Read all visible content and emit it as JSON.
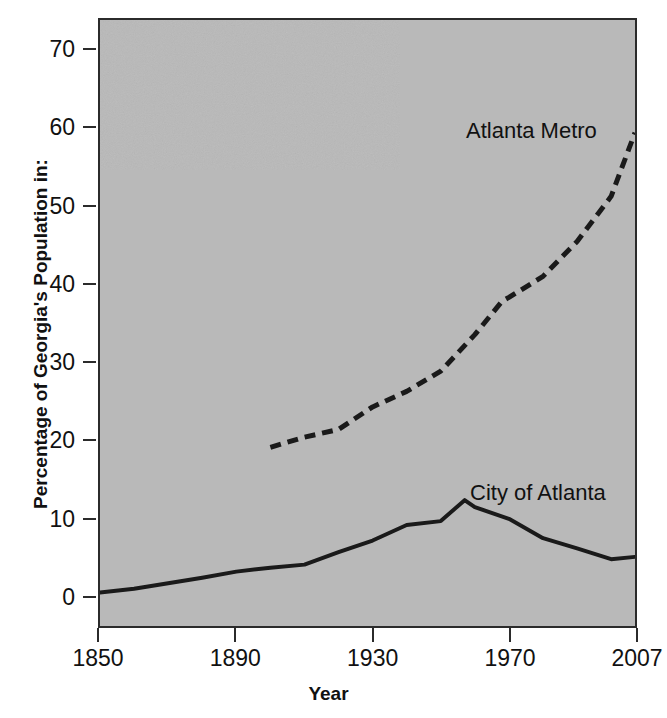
{
  "chart_data": {
    "type": "line",
    "title": "",
    "xlabel": "Year",
    "ylabel": "Percentage of Georgia's Population in:",
    "xlim": [
      1850,
      2007
    ],
    "ylim": [
      -4,
      74
    ],
    "grid": false,
    "legend_position": "inline-annotations",
    "xticks": [
      "1850",
      "1890",
      "1930",
      "1970",
      "2007"
    ],
    "xtick_values": [
      1850,
      1890,
      1930,
      1970,
      2007
    ],
    "yticks": [
      "0",
      "10",
      "20",
      "30",
      "40",
      "50",
      "60",
      "70"
    ],
    "ytick_values": [
      0,
      10,
      20,
      30,
      40,
      50,
      60,
      70
    ],
    "series": [
      {
        "name": "City of Atlanta",
        "style": "solid",
        "color": "#1a1a1a",
        "x": [
          1850,
          1860,
          1870,
          1880,
          1890,
          1900,
          1910,
          1920,
          1930,
          1940,
          1950,
          1957,
          1960,
          1970,
          1980,
          1990,
          2000,
          2007
        ],
        "values": [
          0.3,
          0.8,
          1.5,
          2.2,
          3.0,
          3.5,
          3.9,
          5.5,
          7.0,
          9.0,
          9.5,
          12.2,
          11.3,
          9.8,
          7.3,
          6.0,
          4.6,
          4.9
        ]
      },
      {
        "name": "Atlanta Metro",
        "style": "dashed",
        "color": "#1a1a1a",
        "x": [
          1900,
          1910,
          1920,
          1930,
          1940,
          1950,
          1960,
          1968,
          1970,
          1980,
          1990,
          2000,
          2007
        ],
        "values": [
          19.0,
          20.3,
          21.3,
          24.2,
          26.2,
          28.8,
          33.5,
          37.8,
          38.3,
          41.0,
          45.5,
          51.3,
          59.5
        ]
      }
    ],
    "annotations": [
      {
        "text": "Atlanta Metro",
        "series": "Atlanta Metro"
      },
      {
        "text": "City of Atlanta",
        "series": "City of Atlanta"
      }
    ]
  },
  "axes": {
    "x_title": "Year",
    "y_title": "Percentage of Georgia's Population in:"
  },
  "colors": {
    "plot_background": "#b9b9b9",
    "frame": "#2b2b2b",
    "line": "#1a1a1a",
    "text": "#111111",
    "page_background": "#ffffff"
  }
}
